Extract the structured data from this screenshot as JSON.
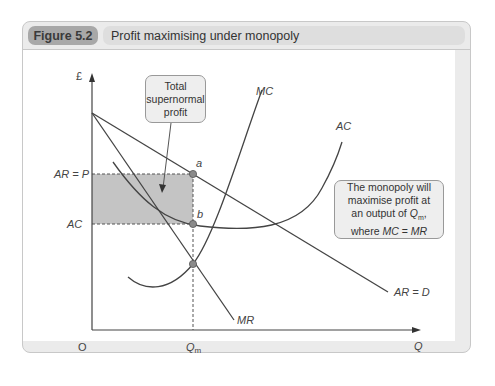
{
  "figure": {
    "label": "Figure 5.2",
    "title": "Profit maximising under monopoly"
  },
  "axes": {
    "y_label": "£",
    "x_label": "Q",
    "origin": "O",
    "x_tick": "Q",
    "x_tick_sub": "m",
    "y_ticks": [
      "AR = P",
      "AC"
    ]
  },
  "curves": {
    "mc": "MC",
    "ac": "AC",
    "mr": "MR",
    "ar": "AR = D"
  },
  "points": {
    "a": "a",
    "b": "b"
  },
  "callouts": {
    "profit": [
      "Total",
      "supernormal",
      "profit"
    ],
    "note_line1": "The monopoly will",
    "note_line2": "maximise profit at",
    "note_line3_prefix": "an output of ",
    "note_line3_q": "Q",
    "note_line3_sub": "m",
    "note_line3_suffix": ",",
    "note_line4_prefix": "where ",
    "note_line4_mc": "MC",
    "note_line4_eq": " = ",
    "note_line4_mr": "MR"
  },
  "colors": {
    "profit_area": "#c4c4c4",
    "curve": "#444444",
    "point": "#8a8a8a",
    "callout_bg": "#eeeeee",
    "fig_label_bg": "#a8a8a8",
    "title_bg": "#dedede"
  }
}
